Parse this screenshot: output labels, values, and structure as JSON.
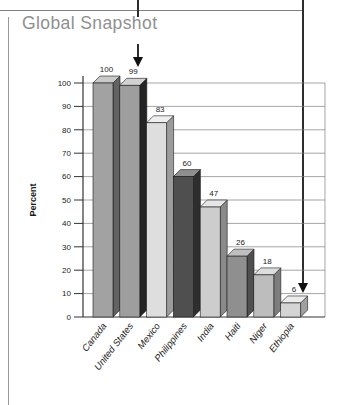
{
  "title": "Global Snapshot",
  "chart_data": {
    "type": "bar",
    "style": "3d-column",
    "title": "Global Snapshot",
    "xlabel": "",
    "ylabel": "Percent",
    "ylim": [
      0,
      100
    ],
    "yticks": [
      0,
      10,
      20,
      30,
      40,
      50,
      60,
      70,
      80,
      90,
      100
    ],
    "grid": true,
    "value_labels": true,
    "legend": "none",
    "categories": [
      "Canada",
      "United States",
      "Mexico",
      "Philippines",
      "India",
      "Haiti",
      "Niger",
      "Ethiopia"
    ],
    "values": [
      100,
      99,
      83,
      60,
      47,
      26,
      18,
      6
    ],
    "bar_colors": [
      {
        "front": "#a2a2a2",
        "top": "#c9c9c9",
        "side": "#636363"
      },
      {
        "front": "#9e9e9e",
        "top": "#d2d2d2",
        "side": "#242424"
      },
      {
        "front": "#dedede",
        "top": "#efefef",
        "side": "#9c9c9c"
      },
      {
        "front": "#4f4f4f",
        "top": "#8f8f8f",
        "side": "#2e2e2e"
      },
      {
        "front": "#cdcdcd",
        "top": "#e6e6e6",
        "side": "#8a8a8a"
      },
      {
        "front": "#8f8f8f",
        "top": "#bfbfbf",
        "side": "#4f4f4f"
      },
      {
        "front": "#bdbdbd",
        "top": "#dddddd",
        "side": "#7d7d7d"
      },
      {
        "front": "#d4d4d4",
        "top": "#ececec",
        "side": "#9f9f9f"
      }
    ],
    "colors": {
      "grid_line": "#808080",
      "axis_line": "#333333",
      "bar_outline": "#1a1a1a",
      "label_text": "#1a1a1a",
      "title_text": "#8f8f8f",
      "annotation_arrow": "#111111"
    }
  },
  "annotations": {
    "arrow_to_united_states_bar": "down-arrow",
    "arrow_to_ethiopia_bar": "down-arrow"
  }
}
